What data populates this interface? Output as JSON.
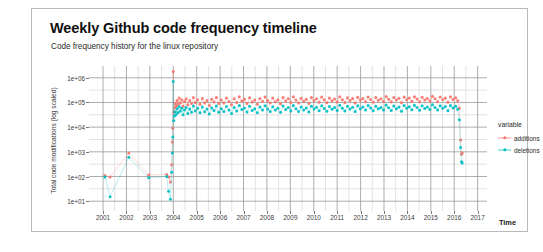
{
  "chart_data": {
    "type": "scatter",
    "title": "Weekly Github code frequency timeline",
    "subtitle": "Code frequency history for the linux repository",
    "xlabel": "Time",
    "ylabel": "Total code modifications (log scaled)",
    "legend_title": "variable",
    "legend_position": "right",
    "grid": true,
    "yscale": "log",
    "ylim": [
      4,
      3000000
    ],
    "xlim": [
      2000.4,
      2017.4
    ],
    "ytick_labels": [
      "1e+06",
      "1e+05",
      "1e+04",
      "1e+03",
      "1e+02",
      "1e+01"
    ],
    "ytick_values": [
      1000000,
      100000,
      10000,
      1000,
      100,
      10
    ],
    "xtick_labels": [
      "2001",
      "2002",
      "2003",
      "2004",
      "2005",
      "2006",
      "2007",
      "2008",
      "2009",
      "2010",
      "2011",
      "2012",
      "2013",
      "2014",
      "2015",
      "2016",
      "2017"
    ],
    "xtick_values": [
      2001,
      2002,
      2003,
      2004,
      2005,
      2006,
      2007,
      2008,
      2009,
      2010,
      2011,
      2012,
      2013,
      2014,
      2015,
      2016,
      2017
    ],
    "colors": {
      "additions": "#F8766D",
      "deletions": "#00BFC4",
      "grid_major": "#999999",
      "grid_minor": "#e2e2e2",
      "panel_background": "#ffffff",
      "card_border": "#b9b9b9"
    },
    "series": [
      {
        "name": "additions",
        "color": "#F8766D",
        "points": [
          [
            2001.08,
            110
          ],
          [
            2001.3,
            95
          ],
          [
            2002.1,
            900
          ],
          [
            2002.95,
            115
          ],
          [
            2003.72,
            120
          ],
          [
            2003.8,
            95
          ],
          [
            2003.88,
            60
          ],
          [
            2003.93,
            300
          ],
          [
            2003.96,
            2500
          ],
          [
            2003.98,
            9000
          ],
          [
            2004.0,
            1800000
          ],
          [
            2004.02,
            40000
          ],
          [
            2004.05,
            60000
          ],
          [
            2004.08,
            90000
          ],
          [
            2004.12,
            70000
          ],
          [
            2004.16,
            120000
          ],
          [
            2004.2,
            85000
          ],
          [
            2004.25,
            150000
          ],
          [
            2004.3,
            95000
          ],
          [
            2004.36,
            130000
          ],
          [
            2004.42,
            70000
          ],
          [
            2004.48,
            110000
          ],
          [
            2004.55,
            140000
          ],
          [
            2004.62,
            80000
          ],
          [
            2004.7,
            120000
          ],
          [
            2004.78,
            90000
          ],
          [
            2004.86,
            160000
          ],
          [
            2004.94,
            100000
          ],
          [
            2005.04,
            130000
          ],
          [
            2005.14,
            85000
          ],
          [
            2005.24,
            145000
          ],
          [
            2005.34,
            95000
          ],
          [
            2005.44,
            120000
          ],
          [
            2005.54,
            75000
          ],
          [
            2005.64,
            135000
          ],
          [
            2005.74,
            105000
          ],
          [
            2005.84,
            160000
          ],
          [
            2005.94,
            90000
          ],
          [
            2006.05,
            125000
          ],
          [
            2006.16,
            95000
          ],
          [
            2006.27,
            150000
          ],
          [
            2006.38,
            110000
          ],
          [
            2006.49,
            80000
          ],
          [
            2006.6,
            140000
          ],
          [
            2006.71,
            100000
          ],
          [
            2006.82,
            170000
          ],
          [
            2006.93,
            115000
          ],
          [
            2007.04,
            135000
          ],
          [
            2007.15,
            90000
          ],
          [
            2007.26,
            155000
          ],
          [
            2007.37,
            105000
          ],
          [
            2007.48,
            125000
          ],
          [
            2007.59,
            85000
          ],
          [
            2007.7,
            145000
          ],
          [
            2007.81,
            110000
          ],
          [
            2007.92,
            165000
          ],
          [
            2008.03,
            120000
          ],
          [
            2008.14,
            95000
          ],
          [
            2008.25,
            150000
          ],
          [
            2008.36,
            108000
          ],
          [
            2008.47,
            130000
          ],
          [
            2008.58,
            88000
          ],
          [
            2008.69,
            160000
          ],
          [
            2008.8,
            115000
          ],
          [
            2008.91,
            140000
          ],
          [
            2009.02,
            100000
          ],
          [
            2009.13,
            170000
          ],
          [
            2009.24,
            125000
          ],
          [
            2009.35,
            95000
          ],
          [
            2009.46,
            148000
          ],
          [
            2009.57,
            112000
          ],
          [
            2009.68,
            135000
          ],
          [
            2009.79,
            90000
          ],
          [
            2009.9,
            158000
          ],
          [
            2010.01,
            120000
          ],
          [
            2010.12,
            142000
          ],
          [
            2010.23,
            102000
          ],
          [
            2010.34,
            165000
          ],
          [
            2010.45,
            128000
          ],
          [
            2010.56,
            98000
          ],
          [
            2010.67,
            152000
          ],
          [
            2010.78,
            118000
          ],
          [
            2010.89,
            138000
          ],
          [
            2011.0,
            105000
          ],
          [
            2011.11,
            172000
          ],
          [
            2011.22,
            130000
          ],
          [
            2011.33,
            100000
          ],
          [
            2011.44,
            155000
          ],
          [
            2011.55,
            120000
          ],
          [
            2011.66,
            143000
          ],
          [
            2011.77,
            95000
          ],
          [
            2011.88,
            162000
          ],
          [
            2011.99,
            125000
          ],
          [
            2012.1,
            145000
          ],
          [
            2012.21,
            108000
          ],
          [
            2012.32,
            168000
          ],
          [
            2012.43,
            132000
          ],
          [
            2012.54,
            102000
          ],
          [
            2012.65,
            158000
          ],
          [
            2012.76,
            122000
          ],
          [
            2012.87,
            140000
          ],
          [
            2012.98,
            110000
          ],
          [
            2013.09,
            175000
          ],
          [
            2013.2,
            135000
          ],
          [
            2013.31,
            105000
          ],
          [
            2013.42,
            160000
          ],
          [
            2013.53,
            125000
          ],
          [
            2013.64,
            148000
          ],
          [
            2013.75,
            98000
          ],
          [
            2013.86,
            168000
          ],
          [
            2013.97,
            128000
          ],
          [
            2014.08,
            150000
          ],
          [
            2014.19,
            112000
          ],
          [
            2014.3,
            172000
          ],
          [
            2014.41,
            138000
          ],
          [
            2014.52,
            106000
          ],
          [
            2014.63,
            162000
          ],
          [
            2014.74,
            126000
          ],
          [
            2014.85,
            145000
          ],
          [
            2014.96,
            115000
          ],
          [
            2015.07,
            178000
          ],
          [
            2015.18,
            140000
          ],
          [
            2015.29,
            108000
          ],
          [
            2015.4,
            165000
          ],
          [
            2015.51,
            130000
          ],
          [
            2015.62,
            152000
          ],
          [
            2015.73,
            102000
          ],
          [
            2015.84,
            170000
          ],
          [
            2015.95,
            132000
          ],
          [
            2016.06,
            155000
          ],
          [
            2016.15,
            118000
          ],
          [
            2016.22,
            60000
          ],
          [
            2016.27,
            3000
          ],
          [
            2016.31,
            800
          ],
          [
            2016.34,
            900
          ]
        ]
      },
      {
        "name": "deletions",
        "color": "#00BFC4",
        "points": [
          [
            2001.08,
            95
          ],
          [
            2001.3,
            15
          ],
          [
            2002.1,
            600
          ],
          [
            2002.95,
            90
          ],
          [
            2003.72,
            100
          ],
          [
            2003.8,
            25
          ],
          [
            2003.88,
            12
          ],
          [
            2003.93,
            150
          ],
          [
            2003.96,
            900
          ],
          [
            2003.98,
            4000
          ],
          [
            2004.0,
            700000
          ],
          [
            2004.02,
            18000
          ],
          [
            2004.05,
            28000
          ],
          [
            2004.08,
            42000
          ],
          [
            2004.12,
            32000
          ],
          [
            2004.16,
            55000
          ],
          [
            2004.2,
            38000
          ],
          [
            2004.25,
            68000
          ],
          [
            2004.3,
            44000
          ],
          [
            2004.36,
            58000
          ],
          [
            2004.42,
            32000
          ],
          [
            2004.48,
            50000
          ],
          [
            2004.55,
            62000
          ],
          [
            2004.62,
            36000
          ],
          [
            2004.7,
            54000
          ],
          [
            2004.78,
            40000
          ],
          [
            2004.86,
            72000
          ],
          [
            2004.94,
            45000
          ],
          [
            2005.04,
            58000
          ],
          [
            2005.14,
            38000
          ],
          [
            2005.24,
            65000
          ],
          [
            2005.34,
            42000
          ],
          [
            2005.44,
            54000
          ],
          [
            2005.54,
            34000
          ],
          [
            2005.64,
            60000
          ],
          [
            2005.74,
            47000
          ],
          [
            2005.84,
            72000
          ],
          [
            2005.94,
            40000
          ],
          [
            2006.05,
            56000
          ],
          [
            2006.16,
            43000
          ],
          [
            2006.27,
            68000
          ],
          [
            2006.38,
            50000
          ],
          [
            2006.49,
            36000
          ],
          [
            2006.6,
            63000
          ],
          [
            2006.71,
            45000
          ],
          [
            2006.82,
            76000
          ],
          [
            2006.93,
            52000
          ],
          [
            2007.04,
            60000
          ],
          [
            2007.15,
            41000
          ],
          [
            2007.26,
            70000
          ],
          [
            2007.37,
            47000
          ],
          [
            2007.48,
            56000
          ],
          [
            2007.59,
            38000
          ],
          [
            2007.7,
            65000
          ],
          [
            2007.81,
            50000
          ],
          [
            2007.92,
            74000
          ],
          [
            2008.03,
            54000
          ],
          [
            2008.14,
            43000
          ],
          [
            2008.25,
            67000
          ],
          [
            2008.36,
            49000
          ],
          [
            2008.47,
            58000
          ],
          [
            2008.58,
            40000
          ],
          [
            2008.69,
            72000
          ],
          [
            2008.8,
            52000
          ],
          [
            2008.91,
            63000
          ],
          [
            2009.02,
            45000
          ],
          [
            2009.13,
            76000
          ],
          [
            2009.24,
            56000
          ],
          [
            2009.35,
            43000
          ],
          [
            2009.46,
            66000
          ],
          [
            2009.57,
            50000
          ],
          [
            2009.68,
            60000
          ],
          [
            2009.79,
            41000
          ],
          [
            2009.9,
            71000
          ],
          [
            2010.01,
            54000
          ],
          [
            2010.12,
            64000
          ],
          [
            2010.23,
            46000
          ],
          [
            2010.34,
            74000
          ],
          [
            2010.45,
            57000
          ],
          [
            2010.56,
            44000
          ],
          [
            2010.67,
            68000
          ],
          [
            2010.78,
            53000
          ],
          [
            2010.89,
            62000
          ],
          [
            2011.0,
            47000
          ],
          [
            2011.11,
            77000
          ],
          [
            2011.22,
            58000
          ],
          [
            2011.33,
            45000
          ],
          [
            2011.44,
            70000
          ],
          [
            2011.55,
            54000
          ],
          [
            2011.66,
            64000
          ],
          [
            2011.77,
            43000
          ],
          [
            2011.88,
            73000
          ],
          [
            2011.99,
            56000
          ],
          [
            2012.1,
            65000
          ],
          [
            2012.21,
            49000
          ],
          [
            2012.32,
            75000
          ],
          [
            2012.43,
            59000
          ],
          [
            2012.54,
            46000
          ],
          [
            2012.65,
            71000
          ],
          [
            2012.76,
            55000
          ],
          [
            2012.87,
            63000
          ],
          [
            2012.98,
            50000
          ],
          [
            2013.09,
            79000
          ],
          [
            2013.2,
            61000
          ],
          [
            2013.31,
            47000
          ],
          [
            2013.42,
            72000
          ],
          [
            2013.53,
            56000
          ],
          [
            2013.64,
            66000
          ],
          [
            2013.75,
            44000
          ],
          [
            2013.86,
            75000
          ],
          [
            2013.97,
            58000
          ],
          [
            2014.08,
            67000
          ],
          [
            2014.19,
            51000
          ],
          [
            2014.3,
            77000
          ],
          [
            2014.41,
            62000
          ],
          [
            2014.52,
            48000
          ],
          [
            2014.63,
            73000
          ],
          [
            2014.74,
            57000
          ],
          [
            2014.85,
            65000
          ],
          [
            2014.96,
            52000
          ],
          [
            2015.07,
            80000
          ],
          [
            2015.18,
            63000
          ],
          [
            2015.29,
            49000
          ],
          [
            2015.4,
            74000
          ],
          [
            2015.51,
            58000
          ],
          [
            2015.62,
            68000
          ],
          [
            2015.73,
            46000
          ],
          [
            2015.84,
            76000
          ],
          [
            2015.95,
            60000
          ],
          [
            2016.06,
            70000
          ],
          [
            2016.15,
            53000
          ],
          [
            2016.22,
            20000
          ],
          [
            2016.27,
            1500
          ],
          [
            2016.31,
            400
          ],
          [
            2016.34,
            350
          ]
        ]
      }
    ]
  }
}
